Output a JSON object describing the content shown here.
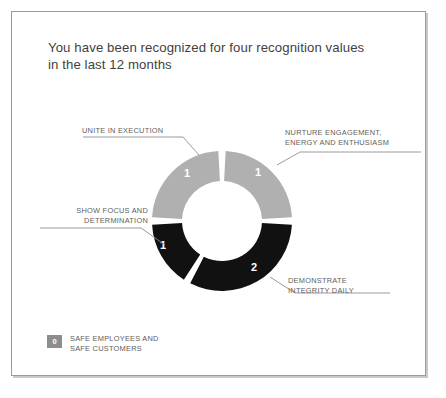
{
  "card": {
    "title": "You have been recognized for four recognition values in the last 12 months"
  },
  "chart_data": {
    "type": "pie",
    "variant": "donut",
    "title": "You have been recognized for four recognition values in the last 12 months",
    "total": 4,
    "legend_position": "outside-callouts",
    "center": {
      "x": 222,
      "y": 221
    },
    "outer_radius": 70,
    "inner_radius": 40,
    "gap_degrees": 6,
    "colors": {
      "light": "#b0b0b0",
      "dark": "#111111",
      "gap": "#ffffff",
      "badge": "#8d8d8d",
      "label_text": "#5e5e5e",
      "title_text": "#3f3f3f",
      "card_border": "#9b9b9b"
    },
    "categories": [
      "NURTURE ENGAGEMENT, ENERGY AND ENTHUSIASM",
      "DEMONSTRATE INTEGRITY DAILY",
      "SHOW FOCUS AND DETERMINATION",
      "UNITE IN EXECUTION"
    ],
    "values": [
      1,
      2,
      1,
      1
    ],
    "slices": [
      {
        "label": "NURTURE ENGAGEMENT,\nENERGY AND ENTHUSIASM",
        "value": "1",
        "color": "#b0b0b0",
        "start_deg": 0,
        "end_deg": 90,
        "value_x": 258,
        "value_y": 176
      },
      {
        "label": "DEMONSTRATE\nINTEGRITY DAILY",
        "value": "2",
        "color": "#111111",
        "start_deg": 90,
        "end_deg": 210,
        "value_x": 254,
        "value_y": 271
      },
      {
        "label": "SHOW FOCUS AND\nDETERMINATION",
        "value": "1",
        "color": "#111111",
        "start_deg": 210,
        "end_deg": 270,
        "value_x": 163,
        "value_y": 249
      },
      {
        "label": "UNITE IN EXECUTION",
        "value": "1",
        "color": "#b0b0b0",
        "start_deg": 270,
        "end_deg": 360,
        "value_x": 187,
        "value_y": 177
      }
    ]
  },
  "callouts": {
    "unite": "UNITE IN EXECUTION",
    "nurture": "NURTURE ENGAGEMENT,\nENERGY AND ENTHUSIASM",
    "focus": "SHOW FOCUS AND\nDETERMINATION",
    "integrity": "DEMONSTRATE\nINTEGRITY DAILY"
  },
  "legend": {
    "badge_value": "0",
    "label": "SAFE EMPLOYEES AND\nSAFE CUSTOMERS"
  }
}
